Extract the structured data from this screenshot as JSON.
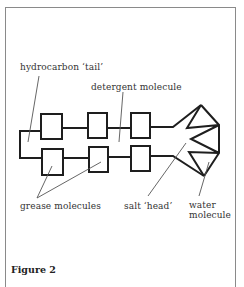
{
  "figure": {
    "caption": "Figure 2",
    "labels": {
      "tail": "hydrocarbon ‘tail’",
      "detergent": "detergent molecule",
      "grease": "grease molecules",
      "head": "salt ‘head’",
      "water_line1": "water",
      "water_line2": "molecule"
    },
    "colors": {
      "stroke": "#1e1e1e",
      "leader": "#555555",
      "frame": "#8a8a8a"
    }
  }
}
